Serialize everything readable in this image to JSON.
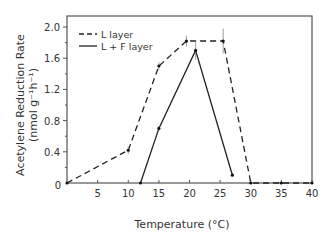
{
  "chart_data": {
    "type": "line",
    "title": "",
    "xlabel": "Temperature (°C)",
    "ylabel_line1": "Acetylene Reduction Rate",
    "ylabel_line2": "(nmol g⁻¹h⁻¹)",
    "xlim": [
      0,
      40
    ],
    "ylim": [
      0,
      2.0
    ],
    "x_ticks": [
      0,
      5,
      10,
      15,
      20,
      25,
      30,
      35,
      40
    ],
    "x_tick_labels": [
      "0",
      "5",
      "10",
      "15",
      "20",
      "25",
      "30",
      "35",
      "40"
    ],
    "y_ticks": [
      0,
      0.4,
      0.8,
      1.2,
      1.6,
      2.0
    ],
    "y_tick_labels": [
      "0",
      "0.4",
      "0.8",
      "1.2",
      "1.6",
      "2.0"
    ],
    "grid": false,
    "legend_position": "upper left",
    "series": [
      {
        "name": "L layer",
        "style": "dashed",
        "color": "#222222",
        "x": [
          0,
          10,
          15,
          19.5,
          25.5,
          30,
          35,
          40
        ],
        "values": [
          0,
          0.42,
          1.5,
          1.82,
          1.82,
          0,
          0,
          0
        ],
        "error": [
          0,
          0.05,
          0.05,
          0.07,
          0.16,
          0,
          0,
          0
        ]
      },
      {
        "name": "L + F layer",
        "style": "solid",
        "color": "#222222",
        "x": [
          12,
          15,
          21,
          27
        ],
        "values": [
          0,
          0.7,
          1.7,
          0.1
        ],
        "error": [
          0,
          0.03,
          0.12,
          0
        ]
      }
    ]
  }
}
